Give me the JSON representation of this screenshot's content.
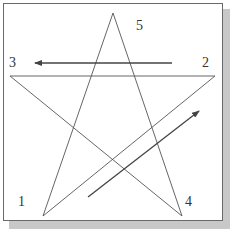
{
  "diagram": {
    "type": "pentagram",
    "vertices": [
      {
        "id": "1",
        "label": "1",
        "x": 43,
        "y": 216,
        "label_x": 18,
        "label_y": 195
      },
      {
        "id": "2",
        "label": "2",
        "x": 215,
        "y": 76,
        "label_x": 202,
        "label_y": 56
      },
      {
        "id": "3",
        "label": "3",
        "x": 10,
        "y": 76,
        "label_x": 9,
        "label_y": 56
      },
      {
        "id": "4",
        "label": "4",
        "x": 182,
        "y": 216,
        "label_x": 185,
        "label_y": 195
      },
      {
        "id": "5",
        "label": "5",
        "x": 113,
        "y": 13,
        "label_x": 136,
        "label_y": 19
      }
    ],
    "edges": [
      [
        "1",
        "5"
      ],
      [
        "5",
        "4"
      ],
      [
        "4",
        "3"
      ],
      [
        "3",
        "2"
      ],
      [
        "2",
        "1"
      ]
    ],
    "arrows": [
      {
        "name": "arrow-2-to-3",
        "x1": 172,
        "y1": 63,
        "x2": 35,
        "y2": 63
      },
      {
        "name": "arrow-1-to-2",
        "x1": 88,
        "y1": 197,
        "x2": 199,
        "y2": 111
      }
    ],
    "colors": {
      "edge": "#555555",
      "arrow": "#444444",
      "frame": "#6a6a6a",
      "shadow": "#c8c8c8"
    }
  }
}
